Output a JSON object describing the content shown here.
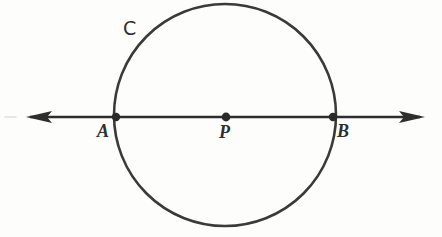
{
  "figure": {
    "background_color": "#fdfdfc",
    "stroke_color": "#3a3a3a",
    "width": 442,
    "height": 237
  },
  "labels": {
    "point_a": "A",
    "point_p": "P",
    "point_b": "B",
    "curve_c": "C"
  },
  "geometry": {
    "circle": {
      "name": "C",
      "center_x": 225,
      "center_y": 115,
      "radius": 111,
      "stroke_width": 2.6
    },
    "line": {
      "name": "line-AB",
      "y": 117,
      "x_start": 26,
      "x_end": 425,
      "stroke_width": 2.6,
      "arrow_left": true,
      "arrow_right": true
    },
    "points": [
      {
        "name": "A",
        "x": 116,
        "y": 117,
        "radius": 4.2
      },
      {
        "name": "P",
        "x": 226,
        "y": 117,
        "radius": 4.4
      },
      {
        "name": "B",
        "x": 333,
        "y": 117,
        "radius": 4.2
      }
    ],
    "artifact_dash": {
      "x": 5,
      "y": 117,
      "width": 11
    }
  }
}
